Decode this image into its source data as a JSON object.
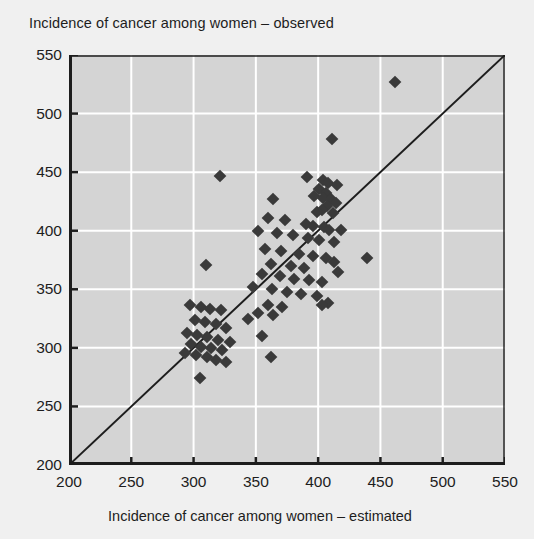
{
  "chart_data": {
    "type": "scatter",
    "title": "Incidence of cancer among women – observed",
    "ylabel": "Incidence of cancer among women – observed",
    "xlabel": "Incidence of cancer among women – estimated",
    "xlim": [
      200,
      550
    ],
    "ylim": [
      200,
      550
    ],
    "xticks": [
      200,
      250,
      300,
      350,
      400,
      450,
      500,
      550
    ],
    "yticks": [
      200,
      250,
      300,
      350,
      400,
      450,
      500,
      550
    ],
    "grid": true,
    "legend": null,
    "annotations": [
      {
        "kind": "reference-line",
        "description": "1:1 diagonal identity line from (200,200) to (550,550)"
      }
    ],
    "colors": {
      "plot_background": "#d4d4d4",
      "figure_background": "#f0f0f0",
      "marker": "#3a3a3a",
      "gridline": "#ffffff",
      "axis": "#1d1d1d",
      "reference_line": "#1d1d1d"
    },
    "marker": {
      "shape": "diamond",
      "size_px": 9
    },
    "points": [
      [
        462,
        527
      ],
      [
        411,
        478
      ],
      [
        321,
        447
      ],
      [
        391,
        446
      ],
      [
        404,
        443
      ],
      [
        408,
        441
      ],
      [
        415,
        439
      ],
      [
        401,
        436
      ],
      [
        406,
        432
      ],
      [
        397,
        430
      ],
      [
        404,
        428
      ],
      [
        410,
        427
      ],
      [
        414,
        424
      ],
      [
        364,
        427
      ],
      [
        407,
        421
      ],
      [
        403,
        418
      ],
      [
        399,
        416
      ],
      [
        412,
        415
      ],
      [
        360,
        411
      ],
      [
        373,
        409
      ],
      [
        390,
        406
      ],
      [
        396,
        404
      ],
      [
        405,
        403
      ],
      [
        409,
        401
      ],
      [
        418,
        401
      ],
      [
        352,
        400
      ],
      [
        367,
        398
      ],
      [
        380,
        396
      ],
      [
        392,
        394
      ],
      [
        401,
        392
      ],
      [
        413,
        390
      ],
      [
        439,
        377
      ],
      [
        357,
        384
      ],
      [
        370,
        383
      ],
      [
        385,
        380
      ],
      [
        396,
        378
      ],
      [
        406,
        377
      ],
      [
        413,
        373
      ],
      [
        362,
        372
      ],
      [
        378,
        370
      ],
      [
        389,
        368
      ],
      [
        416,
        365
      ],
      [
        310,
        371
      ],
      [
        355,
        363
      ],
      [
        369,
        361
      ],
      [
        381,
        359
      ],
      [
        393,
        358
      ],
      [
        403,
        356
      ],
      [
        348,
        352
      ],
      [
        363,
        350
      ],
      [
        375,
        348
      ],
      [
        386,
        346
      ],
      [
        399,
        344
      ],
      [
        408,
        338
      ],
      [
        403,
        337
      ],
      [
        360,
        337
      ],
      [
        371,
        335
      ],
      [
        352,
        330
      ],
      [
        364,
        328
      ],
      [
        344,
        325
      ],
      [
        297,
        337
      ],
      [
        306,
        335
      ],
      [
        313,
        333
      ],
      [
        322,
        332
      ],
      [
        301,
        324
      ],
      [
        309,
        322
      ],
      [
        318,
        320
      ],
      [
        326,
        317
      ],
      [
        295,
        313
      ],
      [
        303,
        311
      ],
      [
        311,
        309
      ],
      [
        320,
        307
      ],
      [
        329,
        305
      ],
      [
        298,
        303
      ],
      [
        306,
        301
      ],
      [
        314,
        300
      ],
      [
        323,
        298
      ],
      [
        293,
        296
      ],
      [
        302,
        294
      ],
      [
        311,
        292
      ],
      [
        318,
        290
      ],
      [
        326,
        288
      ],
      [
        355,
        310
      ],
      [
        362,
        292
      ],
      [
        305,
        274
      ]
    ]
  }
}
